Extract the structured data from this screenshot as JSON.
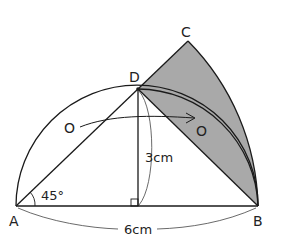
{
  "diagram": {
    "points": {
      "A": {
        "label": "A",
        "x": 16,
        "y": 206
      },
      "B": {
        "label": "B",
        "x": 258,
        "y": 206
      },
      "C": {
        "label": "C",
        "x": 188,
        "y": 41
      },
      "D": {
        "label": "D",
        "x": 138,
        "y": 89
      },
      "O_start": {
        "label": "O",
        "x": 70,
        "y": 128
      },
      "O_end": {
        "label": "O",
        "x": 205,
        "y": 131
      }
    },
    "labels": {
      "angle": "45°",
      "height": "3cm",
      "base": "6cm"
    },
    "colors": {
      "shade": "#a9a9a9",
      "stroke": "#1a1a1a"
    }
  }
}
